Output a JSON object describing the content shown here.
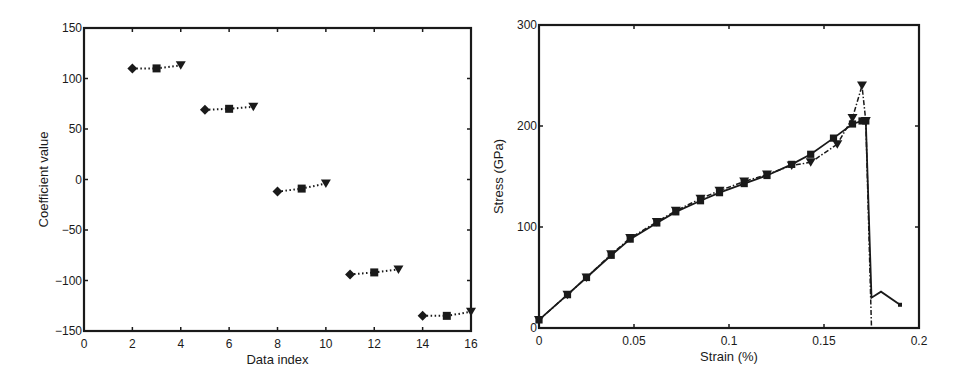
{
  "chart_data": [
    {
      "type": "scatter",
      "title": "",
      "xlabel": "Data index",
      "ylabel": "Coefficient value",
      "xlim": [
        0,
        16
      ],
      "ylim": [
        -150,
        150
      ],
      "xticks": [
        "0",
        "2",
        "4",
        "6",
        "8",
        "10",
        "12",
        "14",
        "16"
      ],
      "yticks": [
        "-150",
        "-100",
        "-50",
        "0",
        "50",
        "100",
        "150"
      ],
      "grid": false,
      "legend": null,
      "groups": [
        {
          "points": [
            {
              "x": 2,
              "y": 110,
              "marker": "diamond"
            },
            {
              "x": 3,
              "y": 110,
              "marker": "square"
            },
            {
              "x": 4,
              "y": 113,
              "marker": "triangle-down"
            }
          ]
        },
        {
          "points": [
            {
              "x": 5,
              "y": 69,
              "marker": "diamond"
            },
            {
              "x": 6,
              "y": 70,
              "marker": "square"
            },
            {
              "x": 7,
              "y": 72,
              "marker": "triangle-down"
            }
          ]
        },
        {
          "points": [
            {
              "x": 8,
              "y": -12,
              "marker": "diamond"
            },
            {
              "x": 9,
              "y": -9,
              "marker": "square"
            },
            {
              "x": 10,
              "y": -4,
              "marker": "triangle-down"
            }
          ]
        },
        {
          "points": [
            {
              "x": 11,
              "y": -94,
              "marker": "diamond"
            },
            {
              "x": 12,
              "y": -92,
              "marker": "square"
            },
            {
              "x": 13,
              "y": -89,
              "marker": "triangle-down"
            }
          ]
        },
        {
          "points": [
            {
              "x": 14,
              "y": -135,
              "marker": "diamond"
            },
            {
              "x": 15,
              "y": -135,
              "marker": "square"
            },
            {
              "x": 16,
              "y": -131,
              "marker": "triangle-down"
            }
          ]
        }
      ],
      "line_style": "dotted"
    },
    {
      "type": "line",
      "title": "",
      "xlabel": "Strain (%)",
      "ylabel": "Stress (GPa)",
      "xlim": [
        0,
        0.2
      ],
      "ylim": [
        0,
        300
      ],
      "xticks": [
        "0",
        "0.05",
        "0.1",
        "0.15",
        "0.2"
      ],
      "yticks": [
        "0",
        "100",
        "200",
        "300"
      ],
      "grid": false,
      "legend": null,
      "series": [
        {
          "name": "solid",
          "style": "solid",
          "marker": "square",
          "x": [
            0,
            0.015,
            0.025,
            0.038,
            0.048,
            0.062,
            0.072,
            0.085,
            0.095,
            0.108,
            0.12,
            0.133,
            0.143,
            0.155,
            0.165,
            0.17,
            0.172,
            0.175,
            0.18,
            0.19
          ],
          "y": [
            8,
            33,
            50,
            72,
            88,
            104,
            115,
            126,
            134,
            143,
            151,
            162,
            172,
            188,
            202,
            205,
            205,
            30,
            36,
            23
          ]
        },
        {
          "name": "dash-dot",
          "style": "dashdot",
          "marker": "triangle-down",
          "x": [
            0,
            0.015,
            0.025,
            0.038,
            0.048,
            0.062,
            0.072,
            0.085,
            0.095,
            0.108,
            0.12,
            0.133,
            0.143,
            0.157,
            0.165,
            0.17,
            0.172,
            0.175
          ],
          "y": [
            8,
            33,
            50,
            73,
            89,
            105,
            116,
            128,
            136,
            145,
            152,
            161,
            164,
            182,
            208,
            240,
            205,
            0
          ]
        }
      ]
    }
  ]
}
